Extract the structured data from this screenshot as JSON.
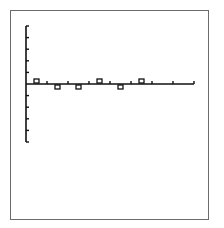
{
  "chart_data": {
    "type": "scatter",
    "title": "",
    "xlabel": "",
    "ylabel": "",
    "x_ticks_count": 8,
    "y_ticks_above": 5,
    "y_ticks_below": 5,
    "grid": false,
    "legend": null,
    "marker": "open-square",
    "series": [
      {
        "name": "points",
        "x": [
          0.5,
          1.5,
          2.5,
          3.5,
          4.5,
          5.5
        ],
        "y": [
          0.25,
          -0.25,
          -0.25,
          0.25,
          -0.25,
          0.25
        ]
      }
    ],
    "xlim": [
      0,
      8
    ],
    "ylim": [
      -5,
      5
    ]
  },
  "colors": {
    "axis": "#111111",
    "frame": "#6b6b6b",
    "marker": "#111111",
    "background": "#ffffff"
  }
}
